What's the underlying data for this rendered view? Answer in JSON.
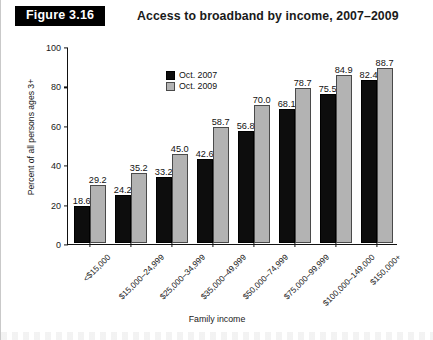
{
  "header": {
    "badge": "Figure 3.16",
    "title": "Access to broadband by income, 2007–2009"
  },
  "chart_data": {
    "type": "bar",
    "title": "Access to broadband by income, 2007–2009",
    "xlabel": "Family income",
    "ylabel": "Percent of all persons ages 3+",
    "ylim": [
      0,
      100
    ],
    "yticks": [
      0,
      20,
      40,
      60,
      80,
      100
    ],
    "grid": false,
    "legend_position": "top-left",
    "categories": [
      "<$15,000",
      "$15,000–24,999",
      "$25,000–34,999",
      "$35,000–49,999",
      "$50,000–74,999",
      "$75,000–99,999",
      "$100,000–149,000",
      "$150,000+"
    ],
    "series": [
      {
        "name": "Oct. 2007",
        "color": "#0d0d0d",
        "values": [
          18.6,
          24.2,
          33.2,
          42.6,
          56.8,
          68.1,
          75.5,
          82.4
        ]
      },
      {
        "name": "Oct. 2009",
        "color": "#b3b3b3",
        "values": [
          29.2,
          35.2,
          45.0,
          58.7,
          70.0,
          78.7,
          84.9,
          88.7
        ]
      }
    ]
  }
}
